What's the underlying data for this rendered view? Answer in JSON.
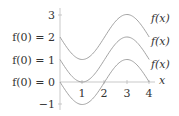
{
  "chart_data": {
    "type": "line",
    "title": "",
    "xlabel": "x",
    "ylabel": "",
    "xlim": [
      0,
      4
    ],
    "ylim": [
      -1,
      3
    ],
    "x_ticks": [
      "1",
      "2",
      "3",
      "4"
    ],
    "y_ticks": [
      "3",
      "2",
      "1",
      "0",
      "-1"
    ],
    "y_tick_labels_override": {
      "2": "f(0) = 2",
      "1": "f(0) = 1",
      "0": "f(0) = 0"
    },
    "series": [
      {
        "name": "f(x)",
        "offset": 2,
        "formula": "2 - sin(pi*x/2)",
        "x": [
          0,
          1,
          2,
          3,
          4
        ],
        "values": [
          2,
          1,
          2,
          3,
          2
        ]
      },
      {
        "name": "f(x)",
        "offset": 1,
        "formula": "1 - sin(pi*x/2)",
        "x": [
          0,
          1,
          2,
          3,
          4
        ],
        "values": [
          1,
          0,
          1,
          2,
          1
        ]
      },
      {
        "name": "f(x)",
        "offset": 0,
        "formula": "0 - sin(pi*x/2)",
        "x": [
          0,
          1,
          2,
          3,
          4
        ],
        "values": [
          0,
          -1,
          0,
          1,
          0
        ]
      }
    ],
    "grid": false,
    "legend": "curve labels at right end"
  },
  "labels": {
    "y3": "3",
    "y2": "f(0) = 2",
    "y1": "f(0) = 1",
    "y0": "f(0) = 0",
    "ym1": "−1",
    "x1": "1",
    "x2": "2",
    "x3": "3",
    "x4": "4",
    "xaxis": "x",
    "curve": "f(x)"
  }
}
